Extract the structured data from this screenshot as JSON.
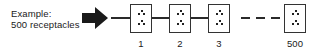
{
  "caption": {
    "line1": "Example:",
    "line2": "500 receptacles"
  },
  "arrow_icon": "right-arrow-icon",
  "receptacles": [
    {
      "label": "1"
    },
    {
      "label": "2"
    },
    {
      "label": "3"
    },
    {
      "label": "500"
    }
  ],
  "colors": {
    "stroke": "#2a2a2a",
    "background": "#ffffff"
  }
}
